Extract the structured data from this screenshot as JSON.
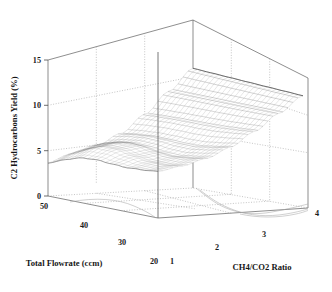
{
  "figure": {
    "type": "surface-3d",
    "background": "#ffffff",
    "line_color": "#5d5d5d",
    "grid_color": "#9e9e9e",
    "mesh_color": "#707070"
  },
  "axes": {
    "z": {
      "label": "C2 Hydrocarbons Yield (%)",
      "ticks": [
        "0",
        "5",
        "10",
        "15"
      ],
      "values": [
        0,
        5,
        10,
        15
      ],
      "range": [
        0,
        15
      ]
    },
    "x": {
      "label": "Total Flowrate (ccm)",
      "ticks": [
        "50",
        "40",
        "30",
        "20"
      ],
      "values": [
        50,
        40,
        30,
        20
      ],
      "range": [
        50,
        20
      ]
    },
    "y": {
      "label": "CH4/CO2 Ratio",
      "ticks": [
        "1",
        "2",
        "3",
        "4"
      ],
      "values": [
        1,
        2,
        3,
        4
      ],
      "range": [
        1,
        4
      ]
    }
  },
  "chart_data": {
    "type": "surface",
    "title": "",
    "xlabel": "Total Flowrate (ccm)",
    "ylabel": "CH4/CO2 Ratio",
    "zlabel": "C2 Hydrocarbons Yield (%)",
    "xlim": [
      20,
      50
    ],
    "ylim": [
      1,
      4
    ],
    "zlim": [
      0,
      15
    ],
    "grid": true,
    "legend": "none",
    "x": [
      20,
      25,
      30,
      35,
      40,
      45,
      50
    ],
    "y": [
      1.0,
      1.5,
      2.0,
      2.5,
      3.0,
      3.5,
      4.0
    ],
    "z_rows_by_y": [
      {
        "y": 1.0,
        "values": [
          5.1,
          4.8,
          4.4,
          4.0,
          3.6,
          3.2,
          2.9
        ]
      },
      {
        "y": 1.5,
        "values": [
          5.6,
          5.3,
          5.0,
          4.6,
          4.2,
          3.8,
          3.5
        ]
      },
      {
        "y": 2.0,
        "values": [
          6.4,
          6.2,
          5.9,
          5.6,
          5.3,
          5.0,
          4.7
        ]
      },
      {
        "y": 2.5,
        "values": [
          7.5,
          7.3,
          7.1,
          6.9,
          6.7,
          6.5,
          6.3
        ]
      },
      {
        "y": 3.0,
        "values": [
          9.0,
          8.9,
          8.8,
          8.7,
          8.6,
          8.5,
          8.4
        ]
      },
      {
        "y": 3.5,
        "values": [
          10.8,
          10.8,
          10.8,
          10.8,
          10.8,
          10.8,
          10.8
        ]
      },
      {
        "y": 4.0,
        "values": [
          12.6,
          12.7,
          12.8,
          12.9,
          13.0,
          13.1,
          13.2
        ]
      }
    ]
  }
}
